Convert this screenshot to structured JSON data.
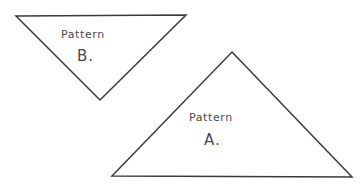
{
  "canvas": {
    "width": 363,
    "height": 187,
    "background_color": "#ffffff",
    "ink_color": "#3a3a3a",
    "text_color": "#4a4a4a",
    "style": "hand-drawn pencil sketch"
  },
  "diagram": {
    "type": "geometry-sketch",
    "shape_count": 2,
    "shapes": [
      {
        "id": "pattern-b",
        "shape": "triangle",
        "orientation": "inverted",
        "label_word": "Pattern",
        "label_letter": "B.",
        "points": "16,16 186,15 100,100",
        "vertices": [
          {
            "x": 16,
            "y": 16
          },
          {
            "x": 186,
            "y": 15
          },
          {
            "x": 100,
            "y": 100
          }
        ]
      },
      {
        "id": "pattern-a",
        "shape": "triangle",
        "orientation": "upright",
        "label_word": "Pattern",
        "label_letter": "A.",
        "points": "232,52 352,177 112,176",
        "vertices": [
          {
            "x": 232,
            "y": 52
          },
          {
            "x": 352,
            "y": 177
          },
          {
            "x": 112,
            "y": 176
          }
        ]
      }
    ]
  }
}
